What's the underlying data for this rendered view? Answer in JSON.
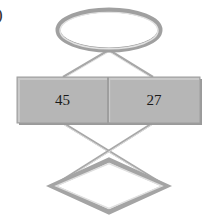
{
  "figure": {
    "background_color": "#ffffff",
    "corner_label": ")",
    "stroke_color": "#9e9e9e",
    "stroke_highlight_color": "#d4d4d4",
    "fill_color": "#b6b6b6",
    "fill_highlight_color": "#c6c6c6",
    "fill_shadow_color": "#9a9a9a",
    "text_color": "#1a1a1a"
  },
  "nodes": {
    "ellipse": {
      "name": "ellipse-node",
      "label": "",
      "shape": "ellipse",
      "cx": 109,
      "cy": 30,
      "rx": 51,
      "ry": 20,
      "filled": false
    },
    "rectangle": {
      "name": "rectangle-node",
      "shape": "rectangle",
      "x": 17,
      "y": 77,
      "width": 183,
      "height": 46,
      "divider_x": 108,
      "filled": true,
      "cells": [
        {
          "name": "cell-left",
          "value": "45"
        },
        {
          "name": "cell-right",
          "value": "27"
        }
      ]
    },
    "diamond": {
      "name": "diamond-node",
      "label": "",
      "shape": "diamond",
      "cx": 109,
      "cy": 186,
      "half_width": 57,
      "half_height": 26,
      "filled": false
    }
  },
  "edges": [
    {
      "name": "edge-ellipse-to-cell-left",
      "from": "ellipse",
      "to": "cell-left",
      "x1": 109,
      "y1": 50,
      "x2": 63,
      "y2": 77
    },
    {
      "name": "edge-ellipse-to-cell-right",
      "from": "ellipse",
      "to": "cell-right",
      "x1": 109,
      "y1": 50,
      "x2": 153,
      "y2": 77
    },
    {
      "name": "edge-cell-left-to-diamond-right",
      "from": "cell-left",
      "to": "diamond",
      "x1": 63,
      "y1": 123,
      "x2": 166,
      "y2": 186
    },
    {
      "name": "edge-cell-right-to-diamond-left",
      "from": "cell-right",
      "to": "diamond",
      "x1": 153,
      "y1": 123,
      "x2": 53,
      "y2": 186
    }
  ]
}
